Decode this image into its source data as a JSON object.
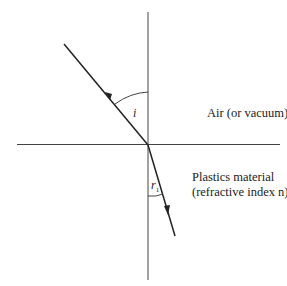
{
  "diagram": {
    "type": "refraction-diagram",
    "labels": {
      "upper_medium": "Air (or vacuum)",
      "lower_medium_line1": "Plastics material",
      "lower_medium_line2": "(refractive index n)",
      "incidence_angle": "i",
      "refraction_angle": "r",
      "refraction_angle_sub": "1"
    },
    "colors": {
      "line": "#333333",
      "background": "#ffffff"
    }
  }
}
